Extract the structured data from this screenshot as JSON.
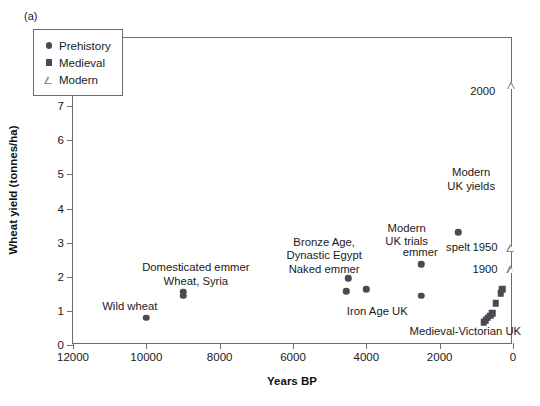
{
  "panel": {
    "label": "(a)"
  },
  "chart_data": {
    "type": "scatter",
    "title": "",
    "xlabel": "Years BP",
    "ylabel": "Wheat yield (tonnes/ha)",
    "xlim": [
      12000,
      0
    ],
    "ylim": [
      0,
      9
    ],
    "x_reversed": true,
    "grid": false,
    "xticks": [
      12000,
      10000,
      8000,
      6000,
      4000,
      2000,
      0
    ],
    "xtick_labels": [
      "12000",
      "10000",
      "8000",
      "6000",
      "4000",
      "2000",
      "0"
    ],
    "yticks": [
      0,
      1,
      2,
      3,
      4,
      5,
      6,
      7,
      8,
      9
    ],
    "ytick_labels": [
      "0",
      "1",
      "2",
      "3",
      "4",
      "5",
      "6",
      "7",
      "8",
      "9"
    ],
    "legend_position": "upper left",
    "series": [
      {
        "name": "Prehistory",
        "marker": "circle",
        "color": "#4a4a52",
        "points": [
          {
            "x": 10000,
            "y": 0.8
          },
          {
            "x": 9000,
            "y": 1.56
          },
          {
            "x": 9000,
            "y": 1.44
          },
          {
            "x": 4500,
            "y": 1.95
          },
          {
            "x": 4550,
            "y": 1.58
          },
          {
            "x": 4000,
            "y": 1.64
          },
          {
            "x": 2500,
            "y": 2.36
          },
          {
            "x": 2500,
            "y": 1.45
          },
          {
            "x": 1500,
            "y": 3.3
          }
        ]
      },
      {
        "name": "Medieval",
        "marker": "square",
        "color": "#4a4a52",
        "points": [
          {
            "x": 800,
            "y": 0.66
          },
          {
            "x": 740,
            "y": 0.72
          },
          {
            "x": 690,
            "y": 0.8
          },
          {
            "x": 620,
            "y": 0.86
          },
          {
            "x": 560,
            "y": 0.93
          },
          {
            "x": 470,
            "y": 1.22
          },
          {
            "x": 330,
            "y": 1.52
          },
          {
            "x": 300,
            "y": 1.63
          }
        ]
      },
      {
        "name": "Modern",
        "marker": "triangle",
        "color": "#8d8d95",
        "points": [
          {
            "x": 55,
            "y": 2.22
          },
          {
            "x": 55,
            "y": 2.85
          },
          {
            "x": 40,
            "y": 7.62
          }
        ]
      }
    ],
    "annotations": [
      {
        "text": "Wild wheat",
        "x": 10450,
        "y": 1.15,
        "align": "center"
      },
      {
        "text": "Domesticated emmer\nWheat, Syria",
        "x": 8650,
        "y": 2.28,
        "align": "center"
      },
      {
        "text": "Bronze Age,\nDynastic Egypt\nNaked emmer",
        "x": 5150,
        "y": 3.02,
        "align": "center"
      },
      {
        "text": "Iron Age UK",
        "x": 3700,
        "y": 1.0,
        "align": "center"
      },
      {
        "text": "Modern\nUK trials",
        "x": 2900,
        "y": 3.43,
        "align": "center"
      },
      {
        "text": "emmer",
        "x": 2530,
        "y": 2.72,
        "align": "center"
      },
      {
        "text": "spelt",
        "x": 1500,
        "y": 2.88,
        "align": "center"
      },
      {
        "text": "Modern\nUK yields",
        "x": 1140,
        "y": 5.06,
        "align": "center"
      },
      {
        "text": "Medieval-Victorian UK",
        "x": 1300,
        "y": 0.4,
        "align": "center"
      },
      {
        "text": "2000",
        "x": 480,
        "y": 7.45,
        "align": "right"
      },
      {
        "text": "1950",
        "x": 420,
        "y": 2.86,
        "align": "right"
      },
      {
        "text": "1900",
        "x": 420,
        "y": 2.22,
        "align": "right"
      }
    ]
  }
}
